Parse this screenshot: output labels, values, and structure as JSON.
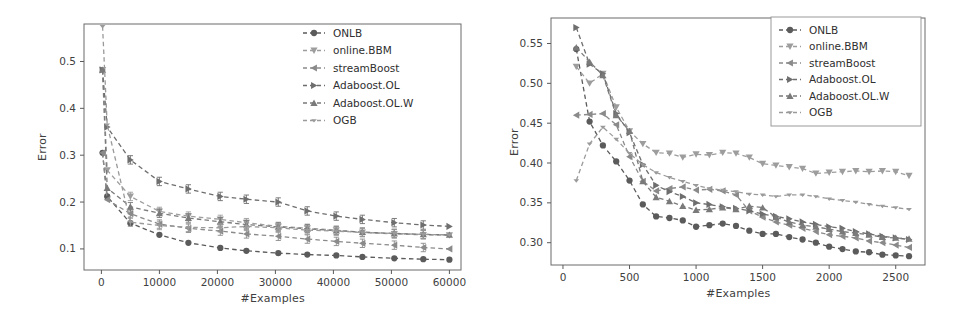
{
  "figure": {
    "background": "#ffffff",
    "panels": [
      "left",
      "right"
    ]
  },
  "common": {
    "xlabel": "#Examples",
    "ylabel": "Error",
    "legend_labels": [
      "ONLB",
      "online.BBM",
      "streamBoost",
      "Adaboost.OL",
      "Adaboost.OL.W",
      "OGB"
    ],
    "legend_markers": [
      "circle-marker",
      "triangle-down-marker",
      "triangle-left-marker",
      "triangle-right-marker",
      "triangle-up-marker",
      "thin-triangle-down-marker"
    ],
    "series_colors": [
      "#5b5b5b",
      "#9d9d9d",
      "#8a8a8a",
      "#6e6e6e",
      "#7a7a7a",
      "#9a9a9a"
    ]
  },
  "chart_data": [
    {
      "type": "line",
      "panel": "left",
      "title": "",
      "xlabel": "#Examples",
      "ylabel": "Error",
      "xlim": [
        -3000,
        62000
      ],
      "ylim": [
        0.055,
        0.58
      ],
      "xticks": [
        0,
        10000,
        20000,
        30000,
        40000,
        50000,
        60000
      ],
      "xticklabels": [
        "0",
        "10000",
        "20000",
        "30000",
        "40000",
        "50000",
        "60000"
      ],
      "yticks": [
        0.1,
        0.2,
        0.3,
        0.4,
        0.5
      ],
      "yticklabels": [
        "0.1",
        "0.2",
        "0.3",
        "0.4",
        "0.5"
      ],
      "grid": false,
      "legend_position": "upper right",
      "linestyle": "dashed",
      "errorbars": true,
      "x": [
        200,
        1000,
        5000,
        10000,
        15000,
        20500,
        25000,
        30500,
        35500,
        40500,
        45000,
        50500,
        55500,
        60000
      ],
      "series": [
        {
          "name": "ONLB",
          "marker": "circle-marker",
          "color": "#5b5b5b",
          "values": [
            0.305,
            0.212,
            0.155,
            0.13,
            0.113,
            0.102,
            0.096,
            0.091,
            0.088,
            0.086,
            0.083,
            0.08,
            0.078,
            0.077
          ]
        },
        {
          "name": "online.BBM",
          "marker": "triangle-down-marker",
          "color": "#9d9d9d",
          "values": [
            0.482,
            0.268,
            0.212,
            0.18,
            0.17,
            0.163,
            0.156,
            0.148,
            0.144,
            0.14,
            0.135,
            0.132,
            0.13,
            0.129
          ]
        },
        {
          "name": "streamBoost",
          "marker": "triangle-left-marker",
          "color": "#8a8a8a",
          "values": [
            0.305,
            0.205,
            0.175,
            0.153,
            0.144,
            0.138,
            0.132,
            0.127,
            0.121,
            0.116,
            0.112,
            0.108,
            0.103,
            0.1
          ]
        },
        {
          "name": "Adaboost.OL",
          "marker": "triangle-right-marker",
          "color": "#6e6e6e",
          "values": [
            0.482,
            0.36,
            0.29,
            0.244,
            0.228,
            0.212,
            0.206,
            0.2,
            0.181,
            0.17,
            0.163,
            0.156,
            0.151,
            0.148
          ]
        },
        {
          "name": "Adaboost.OL.W",
          "marker": "triangle-up-marker",
          "color": "#7a7a7a",
          "values": [
            0.482,
            0.23,
            0.19,
            0.176,
            0.166,
            0.158,
            0.152,
            0.147,
            0.143,
            0.139,
            0.136,
            0.133,
            0.131,
            0.13
          ]
        },
        {
          "name": "OGB",
          "marker": "thin-triangle-down-marker",
          "color": "#9a9a9a",
          "values": [
            0.575,
            0.365,
            0.157,
            0.15,
            0.146,
            0.145,
            0.148,
            0.145,
            0.14,
            0.138,
            0.135,
            0.133,
            0.131,
            0.13
          ]
        }
      ]
    },
    {
      "type": "line",
      "panel": "right",
      "title": "",
      "xlabel": "#Examples",
      "ylabel": "Error",
      "xlim": [
        -90,
        2720
      ],
      "ylim": [
        0.272,
        0.582
      ],
      "xticks": [
        0,
        500,
        1000,
        1500,
        2000,
        2500
      ],
      "xticklabels": [
        "0",
        "500",
        "1000",
        "1500",
        "2000",
        "2500"
      ],
      "yticks": [
        0.3,
        0.35,
        0.4,
        0.45,
        0.5,
        0.55
      ],
      "yticklabels": [
        "0.30",
        "0.35",
        "0.40",
        "0.45",
        "0.50",
        "0.55"
      ],
      "grid": false,
      "legend_position": "upper right",
      "linestyle": "dashed",
      "errorbars": false,
      "x": [
        100,
        200,
        300,
        400,
        500,
        600,
        700,
        800,
        900,
        1000,
        1100,
        1200,
        1300,
        1400,
        1500,
        1600,
        1700,
        1800,
        1900,
        2000,
        2100,
        2200,
        2300,
        2400,
        2500,
        2600
      ],
      "series": [
        {
          "name": "ONLB",
          "marker": "circle-marker",
          "color": "#5b5b5b",
          "values": [
            0.543,
            0.452,
            0.422,
            0.402,
            0.378,
            0.348,
            0.333,
            0.331,
            0.328,
            0.32,
            0.322,
            0.324,
            0.321,
            0.315,
            0.311,
            0.311,
            0.307,
            0.304,
            0.3,
            0.295,
            0.292,
            0.289,
            0.288,
            0.285,
            0.284,
            0.283
          ]
        },
        {
          "name": "online.BBM",
          "marker": "triangle-down-marker",
          "color": "#9d9d9d",
          "values": [
            0.521,
            0.5,
            0.512,
            0.47,
            0.44,
            0.424,
            0.413,
            0.412,
            0.407,
            0.411,
            0.41,
            0.413,
            0.412,
            0.407,
            0.399,
            0.397,
            0.395,
            0.393,
            0.387,
            0.388,
            0.389,
            0.39,
            0.389,
            0.39,
            0.389,
            0.384
          ]
        },
        {
          "name": "streamBoost",
          "marker": "triangle-left-marker",
          "color": "#8a8a8a",
          "values": [
            0.46,
            0.461,
            0.462,
            0.448,
            0.408,
            0.377,
            0.365,
            0.368,
            0.37,
            0.366,
            0.367,
            0.365,
            0.36,
            0.34,
            0.332,
            0.326,
            0.322,
            0.318,
            0.314,
            0.31,
            0.308,
            0.306,
            0.302,
            0.3,
            0.297,
            0.294
          ]
        },
        {
          "name": "Adaboost.OL",
          "marker": "triangle-right-marker",
          "color": "#6e6e6e",
          "values": [
            0.57,
            0.524,
            0.512,
            0.462,
            0.438,
            0.398,
            0.372,
            0.364,
            0.358,
            0.35,
            0.348,
            0.345,
            0.343,
            0.34,
            0.336,
            0.333,
            0.33,
            0.326,
            0.323,
            0.32,
            0.318,
            0.314,
            0.311,
            0.308,
            0.306,
            0.304
          ]
        },
        {
          "name": "Adaboost.OL.W",
          "marker": "triangle-up-marker",
          "color": "#7a7a7a",
          "values": [
            0.545,
            0.527,
            0.51,
            0.46,
            0.44,
            0.377,
            0.357,
            0.352,
            0.346,
            0.341,
            0.342,
            0.344,
            0.342,
            0.346,
            0.344,
            0.332,
            0.326,
            0.322,
            0.32,
            0.317,
            0.314,
            0.312,
            0.31,
            0.307,
            0.306,
            0.305
          ]
        },
        {
          "name": "OGB",
          "marker": "thin-triangle-down-marker",
          "color": "#9a9a9a",
          "values": [
            0.378,
            0.424,
            0.445,
            0.43,
            0.412,
            0.398,
            0.388,
            0.382,
            0.377,
            0.372,
            0.368,
            0.366,
            0.364,
            0.361,
            0.36,
            0.358,
            0.36,
            0.36,
            0.358,
            0.355,
            0.353,
            0.351,
            0.348,
            0.346,
            0.344,
            0.342
          ]
        }
      ]
    }
  ]
}
